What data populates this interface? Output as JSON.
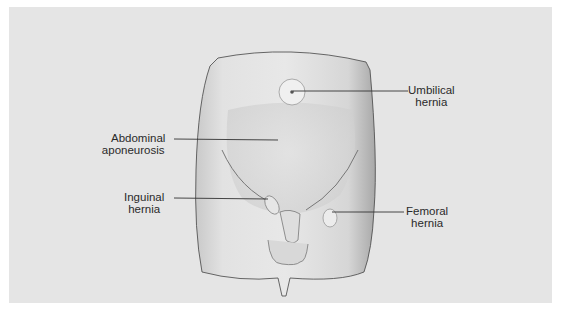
{
  "figure": {
    "background_color": "#e5e5e5",
    "skin_color": "#dcdcdc",
    "line_color": "#333333"
  },
  "labels": {
    "umbilical": {
      "line1": "Umbilical",
      "line2": "hernia"
    },
    "abdominal": {
      "line1": "Abdominal",
      "line2": "aponeurosis"
    },
    "inguinal": {
      "line1": "Inguinal",
      "line2": "hernia"
    },
    "femoral": {
      "line1": "Femoral",
      "line2": "hernia"
    }
  }
}
